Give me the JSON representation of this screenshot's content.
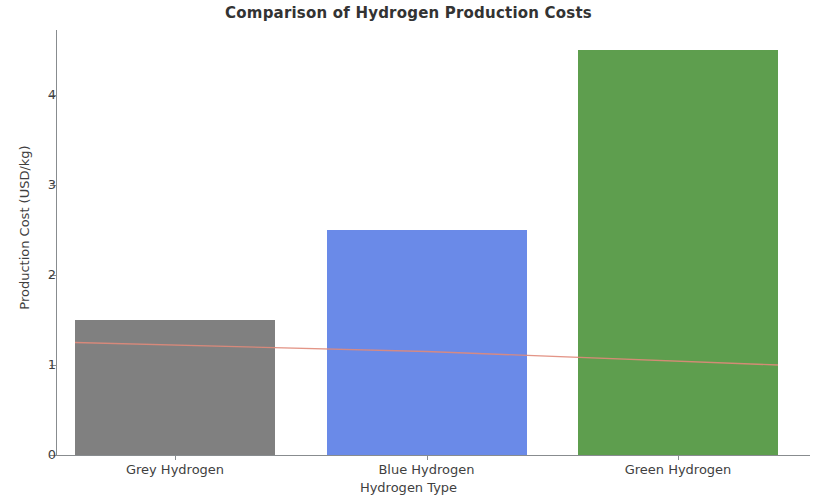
{
  "chart_data": {
    "type": "bar",
    "title": "Comparison of Hydrogen Production Costs",
    "xlabel": "Hydrogen Type",
    "ylabel": "Production Cost (USD/kg)",
    "categories": [
      "Grey Hydrogen",
      "Blue Hydrogen",
      "Green Hydrogen"
    ],
    "values": [
      1.5,
      2.5,
      4.5
    ],
    "bar_colors": [
      "#808080",
      "#6a8ae8",
      "#5e9e4e"
    ],
    "ylim": [
      0,
      4.75
    ],
    "ytick_labels": [
      "0",
      "1",
      "2",
      "3",
      "4"
    ],
    "ytick_values": [
      0,
      1,
      2,
      3,
      4
    ],
    "grid": false,
    "legend": "none",
    "series": [
      {
        "name": "Production Cost",
        "type": "bar",
        "values": [
          1.5,
          2.5,
          4.5
        ]
      },
      {
        "name": "Overlay Trend Line",
        "type": "line",
        "color": "#e08a7a",
        "values": [
          1.25,
          1.15,
          1.0
        ]
      }
    ]
  },
  "axes": {
    "y_tick_0": "0",
    "y_tick_1": "1",
    "y_tick_2": "2",
    "y_tick_3": "3",
    "y_tick_4": "4"
  }
}
